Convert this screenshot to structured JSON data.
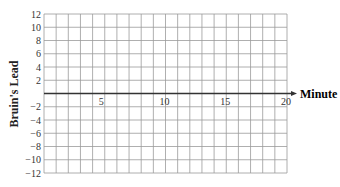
{
  "chart_data": {
    "type": "line",
    "title": "",
    "xlabel": "Minute",
    "ylabel": "Bruin's Lead",
    "xlim": [
      0,
      20
    ],
    "ylim": [
      -12,
      12
    ],
    "x_ticks": [
      5,
      10,
      15,
      20
    ],
    "y_ticks": [
      12,
      10,
      8,
      6,
      4,
      2,
      -2,
      -4,
      -6,
      -8,
      -10,
      -12
    ],
    "grid": true,
    "series": []
  },
  "labels": {
    "x_axis": "Minute",
    "y_axis": "Bruin's Lead",
    "x_tick_labels": [
      "5",
      "10",
      "15",
      "20"
    ],
    "y_tick_labels": [
      "12",
      "10",
      "8",
      "6",
      "4",
      "2",
      "−2",
      "−4",
      "−6",
      "−8",
      "−10",
      "−12"
    ]
  },
  "colors": {
    "grid": "#9a9a9a",
    "axis": "#333333"
  }
}
